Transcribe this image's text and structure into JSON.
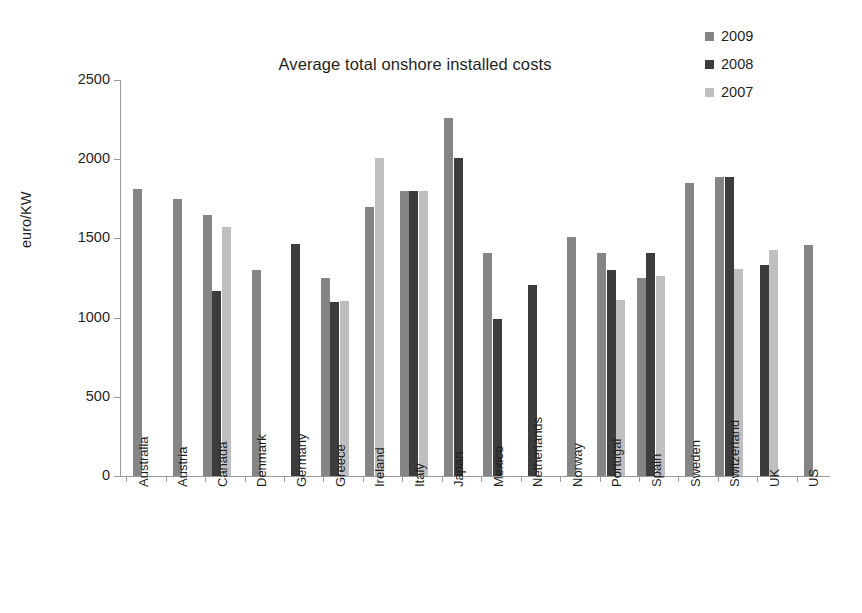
{
  "chart_data": {
    "type": "bar",
    "title": "Average total onshore installed costs",
    "xlabel": "",
    "ylabel": "euro/KW",
    "ylim": [
      0,
      2500
    ],
    "ytick_values": [
      0,
      500,
      1000,
      1500,
      2000,
      2500
    ],
    "ytick_labels": [
      "0",
      "500",
      "1000",
      "1500",
      "2000",
      "2500"
    ],
    "grid": false,
    "legend_position": "top-right",
    "categories": [
      "Australia",
      "Austria",
      "Canada",
      "Denmark",
      "Germany",
      "Greece",
      "Ireland",
      "Italy",
      "Japan",
      "Mexico",
      "Netherlands",
      "Norway",
      "Portugal",
      "Spain",
      "Sweden",
      "Switzerland",
      "UK",
      "US"
    ],
    "series": [
      {
        "name": "2009",
        "color": "#858585",
        "values": [
          1810,
          1750,
          1650,
          1300,
          null,
          1250,
          1700,
          1800,
          2260,
          1410,
          null,
          1510,
          1410,
          1250,
          1850,
          1890,
          null,
          1460
        ]
      },
      {
        "name": "2008",
        "color": "#3c3c3c",
        "values": [
          null,
          null,
          1170,
          null,
          1465,
          1100,
          null,
          1800,
          2010,
          990,
          1205,
          null,
          1300,
          1410,
          null,
          1890,
          1330,
          null
        ]
      },
      {
        "name": "2007",
        "color": "#bfbfbf",
        "values": [
          null,
          null,
          1570,
          null,
          null,
          1105,
          2010,
          1800,
          null,
          null,
          null,
          null,
          1110,
          1260,
          null,
          1310,
          1430,
          null
        ]
      }
    ]
  },
  "legend": {
    "items": [
      {
        "label": "2009",
        "color": "#858585"
      },
      {
        "label": "2008",
        "color": "#3c3c3c"
      },
      {
        "label": "2007",
        "color": "#bfbfbf"
      }
    ]
  }
}
